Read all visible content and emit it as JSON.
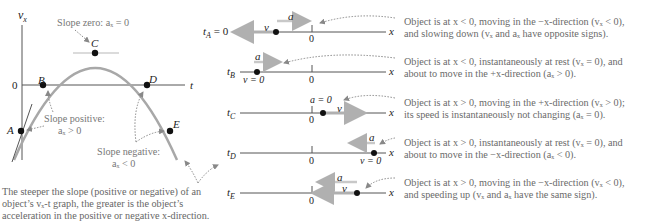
{
  "graph": {
    "y_axis_label": "v",
    "y_axis_sub": "x",
    "x_axis_label": "t",
    "origin_label": "0",
    "points": [
      {
        "id": "A",
        "label": "A"
      },
      {
        "id": "B",
        "label": "B"
      },
      {
        "id": "C",
        "label": "C"
      },
      {
        "id": "D",
        "label": "D"
      },
      {
        "id": "E",
        "label": "E"
      }
    ],
    "annotations": {
      "slope_zero": "Slope zero: aₓ = 0",
      "slope_positive_1": "Slope positive:",
      "slope_positive_2": "aₓ > 0",
      "slope_negative_1": "Slope negative:",
      "slope_negative_2": "aₓ < 0"
    },
    "caption": [
      "The steeper the slope (positive or negative) of an",
      "object’s vₓ-t graph, the greater is the object’s",
      "acceleration in the positive or negative x-direction."
    ]
  },
  "motion_diagrams": [
    {
      "time_label": "t",
      "time_sub": "A",
      "time_suffix": " = 0",
      "axis_label": "x",
      "zero_label": "0",
      "a_label": "a",
      "v_label": "v",
      "description": [
        "Object is at x < 0, moving in the −x-direction (vₓ < 0),",
        "and slowing down (vₓ and aₓ have opposite signs)."
      ]
    },
    {
      "time_label": "t",
      "time_sub": "B",
      "time_suffix": "",
      "axis_label": "x",
      "zero_label": "0",
      "a_label": "a",
      "v_label": "v = 0",
      "description": [
        "Object is at x < 0, instantaneously at rest (vₓ = 0), and",
        "about to move in the +x-direction (aₓ > 0)."
      ]
    },
    {
      "time_label": "t",
      "time_sub": "C",
      "time_suffix": "",
      "axis_label": "x",
      "zero_label": "0",
      "a_label": "a = 0",
      "v_label": "v",
      "description": [
        "Object is at x > 0, moving in the +x-direction (vₓ > 0);",
        "its speed is instantaneously not changing (aₓ = 0)."
      ]
    },
    {
      "time_label": "t",
      "time_sub": "D",
      "time_suffix": "",
      "axis_label": "x",
      "zero_label": "0",
      "a_label": "a",
      "v_label": "v = 0",
      "description": [
        "Object is at x > 0, instantaneously at rest (vₓ = 0), and",
        "about to move in the −x-direction (aₓ < 0)."
      ]
    },
    {
      "time_label": "t",
      "time_sub": "E",
      "time_suffix": "",
      "axis_label": "x",
      "zero_label": "0",
      "a_label": "a",
      "v_label": "v",
      "description": [
        "Object is at x > 0, moving in the −x-direction (vₓ < 0),",
        "and speeding up (vₓ and aₓ have the same sign)."
      ]
    }
  ],
  "colors": {
    "curve": "#a8a8a8",
    "axis": "#555555",
    "arrow": "#b0b0b0",
    "point": "#111111",
    "dotted": "#888888"
  }
}
